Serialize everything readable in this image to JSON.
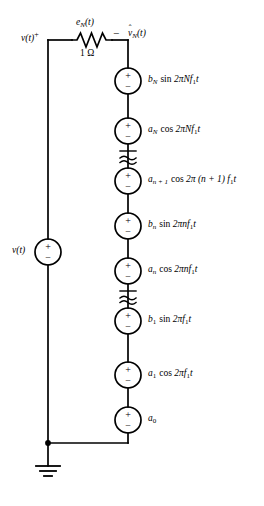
{
  "diagram": {
    "type": "electrical-schematic",
    "colors": {
      "wire": "#000000",
      "background": "#ffffff",
      "text": "#000000"
    }
  },
  "input": {
    "source_label": "v(t)",
    "terminal_label": "v(t)",
    "terminal_polarity": "+"
  },
  "resistor": {
    "label_top_base": "e",
    "label_top_sub": "N",
    "label_top_arg": "(t)",
    "value": "1 Ω",
    "name": "resistor-1-ohm"
  },
  "output": {
    "polarity": "−",
    "name_base": "v",
    "name_hat": "ˆ",
    "name_sub": "N",
    "name_arg": "(t)"
  },
  "ground": {
    "label": "ground"
  },
  "source_stack": [
    {
      "id": "src-bN",
      "coef": "b",
      "coef_sub": "N",
      "func": "sin",
      "arg": "2πNf",
      "arg_sub": "1",
      "arg_tail": "t",
      "plus": "+",
      "minus": "−"
    },
    {
      "id": "src-aN",
      "coef": "a",
      "coef_sub": "N",
      "func": "cos",
      "arg": "2πNf",
      "arg_sub": "1",
      "arg_tail": "t",
      "plus": "+",
      "minus": "−"
    },
    {
      "id": "src-an1",
      "coef": "a",
      "coef_sub": "n + 1",
      "func": "cos",
      "arg": "2π (n + 1) f",
      "arg_sub": "1",
      "arg_tail": "t",
      "plus": "+",
      "minus": "−"
    },
    {
      "id": "src-bn",
      "coef": "b",
      "coef_sub": "n",
      "func": "sin",
      "arg": "2πnf",
      "arg_sub": "1",
      "arg_tail": "t",
      "plus": "+",
      "minus": "−"
    },
    {
      "id": "src-an",
      "coef": "a",
      "coef_sub": "n",
      "func": "cos",
      "arg": "2πnf",
      "arg_sub": "1",
      "arg_tail": "t",
      "plus": "+",
      "minus": "−"
    },
    {
      "id": "src-b1",
      "coef": "b",
      "coef_sub": "1",
      "func": "sin",
      "arg": "2πf",
      "arg_sub": "1",
      "arg_tail": "t",
      "plus": "+",
      "minus": "−"
    },
    {
      "id": "src-a1",
      "coef": "a",
      "coef_sub": "1",
      "func": "cos",
      "arg": "2πf",
      "arg_sub": "1",
      "arg_tail": "t",
      "plus": "+",
      "minus": "−"
    },
    {
      "id": "src-a0",
      "coef": "a",
      "coef_sub": "0",
      "func": "",
      "arg": "",
      "arg_sub": "",
      "arg_tail": "",
      "plus": "+",
      "minus": "−"
    }
  ],
  "breaks": [
    {
      "id": "break-upper",
      "symbol": "≈"
    },
    {
      "id": "break-lower",
      "symbol": "≈"
    }
  ]
}
